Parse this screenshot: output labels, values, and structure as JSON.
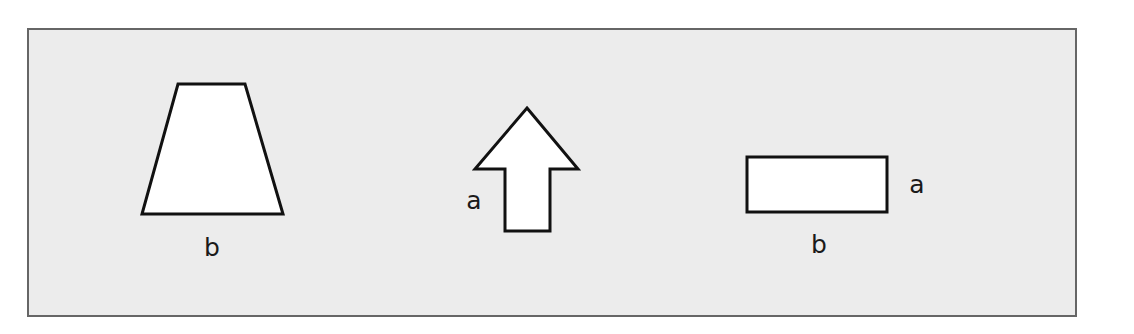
{
  "figure": {
    "background": "#ececec",
    "border_color": "#666666",
    "shape_fill": "#ffffff",
    "shape_stroke": "#111111",
    "shapes": [
      {
        "name": "trapezoid",
        "labels": {
          "bottom": "b"
        }
      },
      {
        "name": "arrow-up",
        "labels": {
          "left": "a"
        }
      },
      {
        "name": "rectangle",
        "labels": {
          "right": "a",
          "bottom": "b"
        }
      }
    ]
  }
}
